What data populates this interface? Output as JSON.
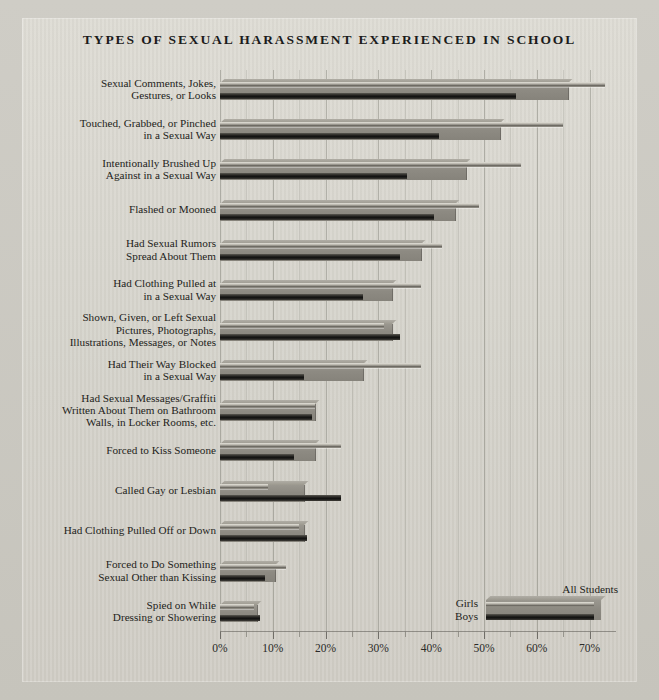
{
  "chart_data": {
    "type": "bar",
    "orientation": "horizontal",
    "title": "Types of Sexual Harassment Experienced in School",
    "xlabel": "",
    "ylabel": "",
    "xlim": [
      0,
      75
    ],
    "grid": true,
    "legend_position": "bottom-right",
    "tick_labels": [
      "0%",
      "10%",
      "20%",
      "30%",
      "40%",
      "50%",
      "60%",
      "70%"
    ],
    "tick_values": [
      0,
      10,
      20,
      30,
      40,
      50,
      60,
      70
    ],
    "minor_tick_values": [
      5,
      15,
      25,
      35,
      45,
      55,
      65
    ],
    "categories": [
      "Sexual Comments, Jokes,\nGestures, or Looks",
      "Touched, Grabbed, or Pinched\nin a Sexual Way",
      "Intentionally Brushed Up\nAgainst in a Sexual Way",
      "Flashed or Mooned",
      "Had Sexual Rumors\nSpread About Them",
      "Had Clothing Pulled at\nin a Sexual Way",
      "Shown, Given, or Left Sexual\nPictures, Photographs,\nIllustrations, Messages, or Notes",
      "Had Their Way Blocked\nin a Sexual Way",
      "Had Sexual Messages/Graffiti\nWritten About Them on Bathroom\nWalls, in Locker Rooms, etc.",
      "Forced to Kiss Someone",
      "Called Gay or Lesbian",
      "Had Clothing Pulled Off or Down",
      "Forced to Do Something\nSexual Other than Kissing",
      "Spied on While\nDressing or Showering"
    ],
    "series": [
      {
        "name": "All Students",
        "color": "#8d8a82",
        "values": [
          66,
          53,
          46.5,
          44.5,
          38,
          32.5,
          32.5,
          27,
          18,
          18,
          16,
          16,
          10.5,
          7
        ]
      },
      {
        "name": "Girls",
        "color": "#b4b1a8",
        "values": [
          73,
          65,
          57,
          49,
          42,
          38,
          31,
          38,
          18,
          23,
          9,
          15,
          12.5,
          6.5
        ]
      },
      {
        "name": "Boys",
        "color": "#262522",
        "values": [
          56,
          41.5,
          35.5,
          40.5,
          34,
          27,
          34,
          16,
          17.5,
          14,
          23,
          16.5,
          8.5,
          7.5
        ]
      }
    ]
  },
  "legend": {
    "all_students_label": "All Students",
    "girls_label": "Girls",
    "boys_label": "Boys"
  }
}
